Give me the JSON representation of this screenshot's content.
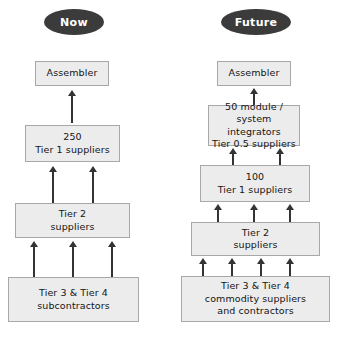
{
  "diagram": {
    "title_now": "Now",
    "title_future": "Future",
    "columns": [
      {
        "key": "now",
        "header": "Now",
        "boxes": [
          {
            "name": "assembler",
            "text": "Assembler"
          },
          {
            "name": "tier-1-suppliers",
            "text": "250\nTier 1 suppliers"
          },
          {
            "name": "tier-2-suppliers",
            "text": "Tier 2\nsuppliers"
          },
          {
            "name": "tier-3-4-subcontractors",
            "text": "Tier 3 & Tier 4\nsubcontractors"
          }
        ]
      },
      {
        "key": "future",
        "header": "Future",
        "boxes": [
          {
            "name": "assembler",
            "text": "Assembler"
          },
          {
            "name": "tier-0-5-suppliers",
            "text": "50 module /\nsystem integrators\nTier 0.5 suppliers"
          },
          {
            "name": "tier-1-suppliers",
            "text": "100\nTier 1 suppliers"
          },
          {
            "name": "tier-2-suppliers",
            "text": "Tier 2\nsuppliers"
          },
          {
            "name": "tier-3-4-commodity-suppliers",
            "text": "Tier 3 & Tier 4\ncommodity suppliers\nand contractors"
          }
        ]
      }
    ],
    "colors": {
      "pill_fill": "#3b3b3b",
      "pill_text": "#ffffff",
      "box_fill": "#ececec",
      "box_border": "#a8a8a8",
      "arrow": "#333333",
      "background": "#ffffff"
    }
  }
}
